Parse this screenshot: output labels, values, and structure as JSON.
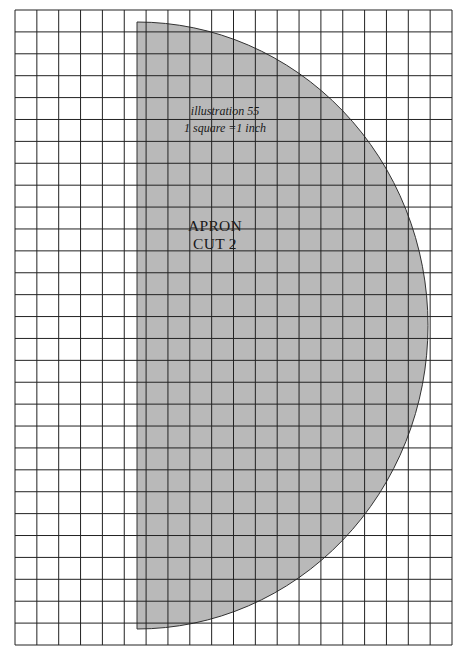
{
  "figure": {
    "caption_line1": "illustration 55",
    "caption_line2": "1 square =1 inch",
    "piece_name": "APRON",
    "piece_instruction": "CUT 2"
  },
  "grid": {
    "left": 15,
    "top": 10,
    "right": 452,
    "bottom": 645,
    "square_px": 22.0,
    "scale": "1 square = 1 inch",
    "line_color": "#222222"
  },
  "shape": {
    "type": "half-ellipse",
    "left": 137,
    "top": 22,
    "bottom": 629,
    "rightmost_x": 428,
    "fill": "#b9b9b9",
    "stroke": "#333333"
  }
}
